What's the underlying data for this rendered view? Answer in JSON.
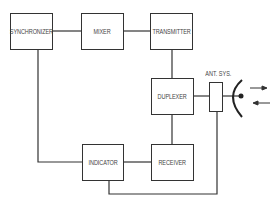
{
  "diagram": {
    "type": "radar block diagram",
    "blocks": {
      "synchronizer": "SYNCHRONIZER",
      "mixer": "MIXER",
      "transmitter": "TRANSMITTER",
      "duplexer": "DUPLEXER",
      "receiver": "RECEIVER",
      "indicator": "INDICATOR"
    },
    "antenna_label": "ANT. SYS.",
    "connections": [
      [
        "SYNCHRONIZER",
        "MIXER"
      ],
      [
        "MIXER",
        "TRANSMITTER"
      ],
      [
        "TRANSMITTER",
        "DUPLEXER"
      ],
      [
        "DUPLEXER",
        "ANT. SYS."
      ],
      [
        "DUPLEXER",
        "RECEIVER"
      ],
      [
        "RECEIVER",
        "INDICATOR"
      ],
      [
        "SYNCHRONIZER",
        "INDICATOR"
      ],
      [
        "ANT. SYS.",
        "INDICATOR"
      ]
    ],
    "signal_arrows": [
      "outgoing",
      "incoming"
    ]
  }
}
